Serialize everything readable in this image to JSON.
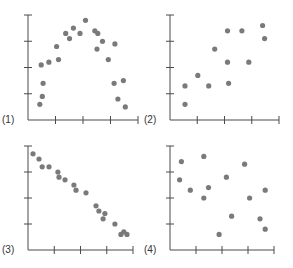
{
  "colors": {
    "axis": "#4a4a4a",
    "dot": "#7a7a7a",
    "label": "#333333",
    "background": "#ffffff"
  },
  "chart_data": [
    {
      "type": "scatter",
      "label": "(1)",
      "title": "",
      "xlabel": "",
      "ylabel": "",
      "description": "inverted-U (quadratic) relationship",
      "grid": false,
      "x_ticks": 5,
      "y_ticks": 5,
      "xlim": [
        0,
        4
      ],
      "ylim": [
        0,
        4
      ],
      "points": [
        [
          0.43,
          0.6
        ],
        [
          0.52,
          0.9
        ],
        [
          0.55,
          1.4
        ],
        [
          0.48,
          2.1
        ],
        [
          0.76,
          2.2
        ],
        [
          1.04,
          2.8
        ],
        [
          1.11,
          2.3
        ],
        [
          1.37,
          3.3
        ],
        [
          1.51,
          3.1
        ],
        [
          1.65,
          3.5
        ],
        [
          1.89,
          3.3
        ],
        [
          2.09,
          3.8
        ],
        [
          2.43,
          3.4
        ],
        [
          2.54,
          3.3
        ],
        [
          2.51,
          2.7
        ],
        [
          2.71,
          3.0
        ],
        [
          2.92,
          2.3
        ],
        [
          3.16,
          2.9
        ],
        [
          3.13,
          1.4
        ],
        [
          3.47,
          1.5
        ],
        [
          3.27,
          0.8
        ],
        [
          3.54,
          0.5
        ]
      ]
    },
    {
      "type": "scatter",
      "label": "(2)",
      "title": "",
      "xlabel": "",
      "ylabel": "",
      "description": "moderate positive linear relationship",
      "grid": false,
      "x_ticks": 5,
      "y_ticks": 5,
      "xlim": [
        0,
        4
      ],
      "ylim": [
        0,
        4
      ],
      "points": [
        [
          0.55,
          1.3
        ],
        [
          0.55,
          0.6
        ],
        [
          1.02,
          1.7
        ],
        [
          1.42,
          1.3
        ],
        [
          1.64,
          2.7
        ],
        [
          2.11,
          3.4
        ],
        [
          2.11,
          2.2
        ],
        [
          2.15,
          1.4
        ],
        [
          2.64,
          3.4
        ],
        [
          2.89,
          2.2
        ],
        [
          3.4,
          3.6
        ],
        [
          3.47,
          3.1
        ]
      ]
    },
    {
      "type": "scatter",
      "label": "(3)",
      "title": "",
      "xlabel": "",
      "ylabel": "",
      "description": "strong negative linear relationship",
      "grid": false,
      "x_ticks": 5,
      "y_ticks": 5,
      "xlim": [
        0,
        4
      ],
      "ylim": [
        0,
        4
      ],
      "points": [
        [
          0.19,
          3.7
        ],
        [
          0.42,
          3.5
        ],
        [
          0.54,
          3.2
        ],
        [
          0.8,
          3.2
        ],
        [
          1.14,
          3.0
        ],
        [
          1.18,
          2.8
        ],
        [
          1.41,
          2.7
        ],
        [
          1.75,
          2.5
        ],
        [
          1.83,
          2.3
        ],
        [
          2.21,
          2.2
        ],
        [
          2.59,
          1.7
        ],
        [
          2.7,
          1.5
        ],
        [
          2.93,
          1.4
        ],
        [
          2.86,
          1.2
        ],
        [
          3.31,
          1.0
        ],
        [
          3.54,
          0.6
        ],
        [
          3.65,
          0.7
        ],
        [
          3.77,
          0.6
        ]
      ]
    },
    {
      "type": "scatter",
      "label": "(4)",
      "title": "",
      "xlabel": "",
      "ylabel": "",
      "description": "no apparent relationship",
      "grid": false,
      "x_ticks": 5,
      "y_ticks": 5,
      "xlim": [
        0,
        4
      ],
      "ylim": [
        0,
        4
      ],
      "points": [
        [
          0.44,
          3.4
        ],
        [
          1.3,
          3.6
        ],
        [
          0.37,
          2.7
        ],
        [
          0.78,
          2.3
        ],
        [
          1.48,
          2.4
        ],
        [
          1.3,
          2.0
        ],
        [
          2.17,
          2.8
        ],
        [
          2.87,
          3.3
        ],
        [
          3.06,
          2.0
        ],
        [
          3.66,
          2.3
        ],
        [
          2.37,
          1.3
        ],
        [
          3.46,
          1.2
        ],
        [
          3.66,
          0.8
        ],
        [
          1.89,
          0.6
        ]
      ]
    }
  ]
}
